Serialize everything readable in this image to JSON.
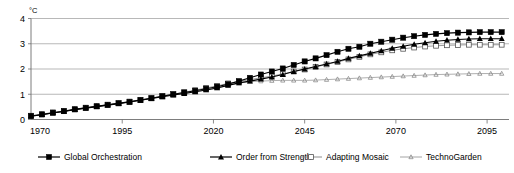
{
  "chart_data": {
    "type": "line",
    "title": "",
    "xlabel": "",
    "ylabel": "",
    "unit_label": "°C",
    "xlim": [
      1970,
      2101
    ],
    "ylim": [
      0,
      4
    ],
    "yticks": [
      0,
      1,
      2,
      3,
      4
    ],
    "ytick_labels": [
      "0",
      "1",
      "2",
      "3",
      "4"
    ],
    "xticks": [
      1970,
      1995,
      2020,
      2045,
      2070,
      2095
    ],
    "xtick_labels": [
      "1970",
      "1995",
      "2020",
      "2045",
      "2070",
      "2095"
    ],
    "grid": true,
    "legend_position": "bottom",
    "x": [
      1970,
      1973,
      1976,
      1979,
      1982,
      1985,
      1988,
      1991,
      1994,
      1997,
      2000,
      2003,
      2006,
      2009,
      2012,
      2015,
      2018,
      2021,
      2024,
      2027,
      2030,
      2033,
      2036,
      2039,
      2042,
      2045,
      2048,
      2051,
      2054,
      2057,
      2060,
      2063,
      2066,
      2069,
      2072,
      2075,
      2078,
      2081,
      2084,
      2087,
      2090,
      2093,
      2096,
      2099
    ],
    "series": [
      {
        "name": "Global Orchestration",
        "marker": "filled-square",
        "color": "#000000",
        "values": [
          0.14,
          0.2,
          0.27,
          0.33,
          0.4,
          0.46,
          0.52,
          0.58,
          0.64,
          0.7,
          0.77,
          0.84,
          0.92,
          1.0,
          1.07,
          1.14,
          1.22,
          1.3,
          1.4,
          1.52,
          1.65,
          1.78,
          1.9,
          2.02,
          2.16,
          2.3,
          2.42,
          2.55,
          2.68,
          2.8,
          2.88,
          3.0,
          3.08,
          3.16,
          3.24,
          3.3,
          3.35,
          3.39,
          3.42,
          3.44,
          3.45,
          3.46,
          3.46,
          3.46
        ]
      },
      {
        "name": "Order from Strength",
        "marker": "filled-triangle",
        "color": "#000000",
        "values": [
          0.13,
          0.19,
          0.26,
          0.32,
          0.39,
          0.45,
          0.51,
          0.57,
          0.63,
          0.69,
          0.76,
          0.83,
          0.9,
          0.97,
          1.03,
          1.1,
          1.17,
          1.25,
          1.35,
          1.45,
          1.52,
          1.6,
          1.68,
          1.78,
          1.9,
          2.0,
          2.1,
          2.2,
          2.3,
          2.42,
          2.52,
          2.62,
          2.72,
          2.82,
          2.9,
          2.98,
          3.04,
          3.1,
          3.14,
          3.17,
          3.19,
          3.2,
          3.2,
          3.2
        ]
      },
      {
        "name": "Adapting Mosaic",
        "marker": "open-square",
        "color": "#7f7f7f",
        "values": [
          0.15,
          0.21,
          0.28,
          0.34,
          0.41,
          0.47,
          0.53,
          0.59,
          0.65,
          0.71,
          0.78,
          0.85,
          0.93,
          1.0,
          1.08,
          1.16,
          1.25,
          1.33,
          1.43,
          1.5,
          1.58,
          1.65,
          1.72,
          1.8,
          1.9,
          1.98,
          2.08,
          2.18,
          2.28,
          2.38,
          2.48,
          2.58,
          2.66,
          2.74,
          2.8,
          2.85,
          2.89,
          2.92,
          2.94,
          2.95,
          2.96,
          2.96,
          2.96,
          2.96
        ]
      },
      {
        "name": "TechnoGarden",
        "marker": "small-triangle",
        "color": "#9a9a9a",
        "values": [
          0.13,
          0.19,
          0.26,
          0.32,
          0.39,
          0.45,
          0.51,
          0.57,
          0.63,
          0.69,
          0.76,
          0.83,
          0.9,
          0.97,
          1.03,
          1.1,
          1.17,
          1.25,
          1.35,
          1.44,
          1.5,
          1.52,
          1.54,
          1.55,
          1.55,
          1.55,
          1.56,
          1.58,
          1.6,
          1.62,
          1.64,
          1.66,
          1.68,
          1.7,
          1.72,
          1.74,
          1.76,
          1.78,
          1.79,
          1.8,
          1.81,
          1.82,
          1.82,
          1.82
        ]
      }
    ]
  },
  "legend": {
    "items": [
      {
        "label": "Global Orchestration",
        "marker": "filled-square"
      },
      {
        "label": "Order from Strength",
        "marker": "filled-triangle"
      },
      {
        "label": "Adapting Mosaic",
        "marker": "open-square"
      },
      {
        "label": "TechnoGarden",
        "marker": "small-triangle"
      }
    ]
  }
}
